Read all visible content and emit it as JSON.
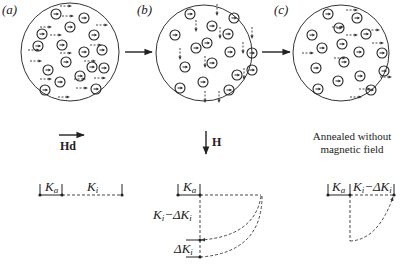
{
  "panels": [
    {
      "id": "a",
      "label": "(a)",
      "cx": 70,
      "cy": 52,
      "r": 49,
      "grains": [
        [
          56,
          14
        ],
        [
          84,
          18
        ],
        [
          42,
          34
        ],
        [
          70,
          27
        ],
        [
          94,
          35
        ],
        [
          38,
          46
        ],
        [
          62,
          45
        ],
        [
          84,
          52
        ],
        [
          102,
          50
        ],
        [
          48,
          70
        ],
        [
          66,
          62
        ],
        [
          92,
          67
        ],
        [
          80,
          76
        ],
        [
          104,
          68
        ],
        [
          45,
          90
        ],
        [
          60,
          82
        ],
        [
          96,
          89
        ]
      ],
      "moments": {
        "dir": "right",
        "items": [
          [
            60,
            6
          ],
          [
            62,
            16
          ],
          [
            96,
            25
          ],
          [
            40,
            27
          ],
          [
            50,
            35
          ],
          [
            90,
            45
          ],
          [
            28,
            50
          ],
          [
            60,
            53
          ],
          [
            30,
            61
          ],
          [
            84,
            61
          ],
          [
            40,
            79
          ],
          [
            74,
            79
          ],
          [
            94,
            78
          ],
          [
            58,
            97
          ],
          [
            76,
            88
          ]
        ]
      }
    },
    {
      "id": "b",
      "label": "(b)",
      "cx": 204,
      "cy": 53,
      "r": 48,
      "grains": [
        [
          190,
          14
        ],
        [
          234,
          18
        ],
        [
          212,
          26
        ],
        [
          175,
          35
        ],
        [
          228,
          34
        ],
        [
          196,
          48
        ],
        [
          207,
          43
        ],
        [
          230,
          52
        ],
        [
          252,
          53
        ],
        [
          185,
          67
        ],
        [
          212,
          63
        ],
        [
          237,
          75
        ],
        [
          252,
          70
        ],
        [
          180,
          88
        ],
        [
          203,
          82
        ],
        [
          229,
          90
        ]
      ],
      "moments": {
        "dir": "down",
        "items": [
          [
            217,
            4
          ],
          [
            196,
            20
          ],
          [
            220,
            27
          ],
          [
            252,
            27
          ],
          [
            243,
            42
          ],
          [
            180,
            48
          ],
          [
            205,
            56
          ],
          [
            244,
            68
          ],
          [
            205,
            91
          ],
          [
            219,
            91
          ]
        ]
      }
    },
    {
      "id": "c",
      "label": "(c)",
      "cx": 341,
      "cy": 53,
      "r": 48,
      "grains": [
        [
          328,
          14
        ],
        [
          357,
          18
        ],
        [
          339,
          28
        ],
        [
          312,
          35
        ],
        [
          366,
          34
        ],
        [
          322,
          48
        ],
        [
          342,
          44
        ],
        [
          359,
          52
        ],
        [
          382,
          53
        ],
        [
          316,
          68
        ],
        [
          344,
          62
        ],
        [
          360,
          76
        ],
        [
          384,
          71
        ],
        [
          338,
          81
        ],
        [
          318,
          89
        ],
        [
          371,
          90
        ]
      ],
      "moments": {
        "dir": "right",
        "items": [
          [
            346,
            10
          ],
          [
            332,
            27
          ],
          [
            368,
            30
          ],
          [
            346,
            35
          ],
          [
            372,
            43
          ],
          [
            302,
            53
          ],
          [
            334,
            58
          ],
          [
            380,
            77
          ],
          [
            359,
            89
          ],
          [
            350,
            97
          ]
        ]
      }
    }
  ],
  "transitions": [
    {
      "x1": 125,
      "x2": 152,
      "y": 52
    },
    {
      "x1": 262,
      "x2": 290,
      "y": 52
    }
  ],
  "fields": {
    "a": {
      "label": "Hd",
      "dir": "right"
    },
    "b": {
      "label": "H",
      "dir": "down"
    },
    "c": {
      "label_line1": "Annealed without",
      "label_line2": "magnetic field"
    }
  },
  "energy": {
    "a": {
      "ka": "K",
      "ka_sub": "a",
      "ki": "K",
      "ki_sub": "i"
    },
    "b": {
      "ka": "K",
      "ka_sub": "a",
      "ki_minus": "K",
      "ki_minus_sub": "i",
      "minus": "−ΔK",
      "minus_sub": "i",
      "delta": "ΔK",
      "delta_sub": "i"
    },
    "c": {
      "ka": "K",
      "ka_sub": "a",
      "ki_minus": "K",
      "ki_minus_sub": "i",
      "minus": "−ΔK",
      "minus_sub": "i"
    }
  }
}
